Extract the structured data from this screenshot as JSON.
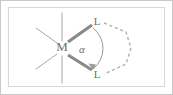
{
  "figure": {
    "type": "chemical-structure-diagram",
    "background_color": "#ffffff",
    "frame": {
      "outer_border_color": "#c9c9c9",
      "inner_border_color": "#d8d8d8",
      "outer_border_width": 1,
      "inner_border_width": 1
    },
    "colors": {
      "bold_bond": "#8a8a8a",
      "thin_bond": "#a8a8a8",
      "dashed_bond": "#b0b0b0",
      "arc": "#9a9a9a",
      "text": "#6e6e6e"
    }
  },
  "atoms": [
    {
      "id": "metal-center",
      "label": "M",
      "x": 62,
      "y": 48,
      "font_size": 13
    },
    {
      "id": "ligand-donor-top",
      "label": "L",
      "x": 97,
      "y": 22,
      "font_size": 11
    },
    {
      "id": "ligand-donor-bottom",
      "label": "L",
      "x": 97,
      "y": 75,
      "font_size": 11
    }
  ],
  "angle": {
    "symbol": "α",
    "name": "bite-angle",
    "x": 82,
    "y": 50,
    "font_size": 11
  },
  "bonds": {
    "bold": [
      {
        "id": "bond-M-L-top",
        "x1": 68,
        "y1": 42,
        "x2": 92,
        "y2": 25
      },
      {
        "id": "bond-M-L-bottom",
        "x1": 68,
        "y1": 55,
        "x2": 92,
        "y2": 70
      }
    ],
    "thin": [
      {
        "id": "bond-axial-up",
        "x1": 62,
        "y1": 13,
        "x2": 62,
        "y2": 41
      },
      {
        "id": "bond-axial-down",
        "x1": 62,
        "y1": 56,
        "x2": 62,
        "y2": 83
      },
      {
        "id": "bond-left-upper",
        "x1": 57,
        "y1": 43,
        "x2": 36,
        "y2": 28
      },
      {
        "id": "bond-left-lower",
        "x1": 57,
        "y1": 54,
        "x2": 36,
        "y2": 69
      }
    ],
    "dashed_backbone": {
      "id": "chelate-backbone",
      "points": "104,23 126,32 131,48 126,64 104,74"
    }
  },
  "arc": {
    "id": "bite-angle-arc",
    "path": "M 93,28 A 26,26 0 0 1 93,69",
    "arrow_points": "93,69 89,63 96,64"
  }
}
